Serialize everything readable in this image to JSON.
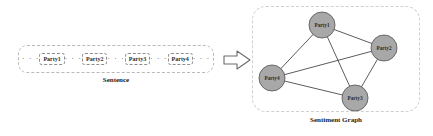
{
  "figure": {
    "width": 433,
    "height": 136,
    "background": "#ffffff"
  },
  "sentence_panel": {
    "caption": "Sentence",
    "leading_ellipsis": "· · ·",
    "tokens": [
      {
        "label": "Party1"
      },
      {
        "label": "Party2"
      },
      {
        "label": "Party3"
      },
      {
        "label": "Party4"
      }
    ],
    "separators": [
      "· · ·",
      "· · ·",
      "· · ·"
    ],
    "trailing_ellipsis": "· · ·",
    "border_color": "#b9b9b9",
    "token_border_color": "#8e8e8e"
  },
  "arrow": {
    "icon": "right-block-arrow",
    "fill": "#ffffff",
    "stroke": "#6b6b6b"
  },
  "graph_panel": {
    "caption": "Sentiment Graph",
    "border_color": "#cfcfcf",
    "node_fill": "#a8a8a8",
    "node_stroke": "#5d5d5d",
    "edge_color": "#4a4a4a",
    "nodes": [
      {
        "id": "party1",
        "label": "Party1",
        "cx": 70,
        "cy": 19,
        "r": 13
      },
      {
        "id": "party2",
        "label": "Party2",
        "cx": 132,
        "cy": 42,
        "r": 13
      },
      {
        "id": "party3",
        "label": "Party3",
        "cx": 103,
        "cy": 92,
        "r": 13
      },
      {
        "id": "party4",
        "label": "Party4",
        "cx": 20,
        "cy": 72,
        "r": 13
      }
    ],
    "edges": [
      {
        "from": "party1",
        "to": "party2"
      },
      {
        "from": "party1",
        "to": "party3"
      },
      {
        "from": "party1",
        "to": "party4"
      },
      {
        "from": "party2",
        "to": "party3"
      },
      {
        "from": "party2",
        "to": "party4"
      },
      {
        "from": "party3",
        "to": "party4"
      }
    ]
  }
}
